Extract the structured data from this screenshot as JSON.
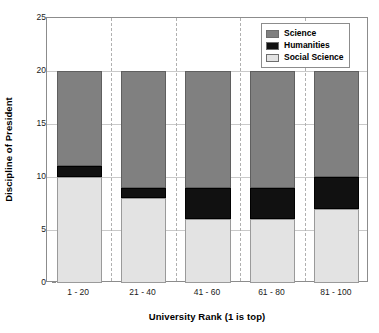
{
  "chart_data": {
    "type": "bar",
    "subtype": "stacked-bar",
    "title": "",
    "xlabel": "University Rank (1 is top)",
    "ylabel": "Discipline of President",
    "categories": [
      "1 - 20",
      "21 - 40",
      "41 - 60",
      "61 - 80",
      "81 - 100"
    ],
    "series": [
      {
        "name": "Social Science",
        "color": "#e3e3e3",
        "values": [
          10,
          8,
          6,
          6,
          7
        ]
      },
      {
        "name": "Humanities",
        "color": "#111111",
        "values": [
          1,
          1,
          3,
          3,
          3
        ]
      },
      {
        "name": "Science",
        "color": "#808080",
        "values": [
          9,
          11,
          11,
          11,
          10
        ]
      }
    ],
    "stack_order_bottom_to_top": [
      "Social Science",
      "Humanities",
      "Science"
    ],
    "totals": [
      20,
      20,
      20,
      20,
      20
    ],
    "ylim": [
      0,
      25
    ],
    "yticks": [
      0,
      5,
      10,
      15,
      20,
      25
    ],
    "ytick_labels": [
      "0",
      "5",
      "10",
      "15",
      "20",
      "25"
    ],
    "grid": {
      "horizontal": true,
      "vertical_dashed_category_separators": true
    },
    "legend": {
      "position": "top-right",
      "entries": [
        {
          "label": "Science",
          "color": "#808080"
        },
        {
          "label": "Humanities",
          "color": "#111111"
        },
        {
          "label": "Social Science",
          "color": "#e3e3e3"
        }
      ]
    },
    "segment_boundaries": {
      "1 - 20": {
        "social_science": [
          0,
          10
        ],
        "humanities": [
          10,
          11
        ],
        "science": [
          11,
          20
        ]
      },
      "21 - 40": {
        "social_science": [
          0,
          8
        ],
        "humanities": [
          8,
          9
        ],
        "science": [
          9,
          20
        ]
      },
      "41 - 60": {
        "social_science": [
          0,
          6
        ],
        "humanities": [
          6,
          9
        ],
        "science": [
          9,
          20
        ]
      },
      "61 - 80": {
        "social_science": [
          0,
          6
        ],
        "humanities": [
          6,
          9
        ],
        "science": [
          9,
          20
        ]
      },
      "81 - 100": {
        "social_science": [
          0,
          7
        ],
        "humanities": [
          7,
          10
        ],
        "science": [
          10,
          20
        ]
      }
    }
  }
}
